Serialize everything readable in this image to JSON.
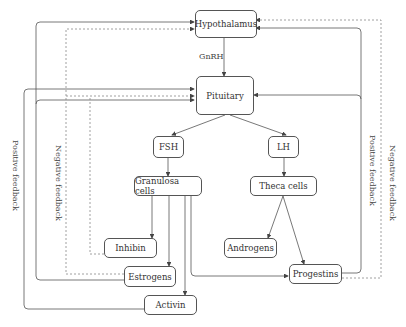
{
  "nodes": {
    "hypothalamus": "Hypothalamus",
    "pituitary": "Pituitary",
    "fsh": "FSH",
    "lh": "LH",
    "granulosa": "Granulosa cells",
    "theca": "Theca cells",
    "inhibin": "Inhibin",
    "estrogens": "Estrogens",
    "activin": "Activin",
    "androgens": "Androgens",
    "progestins": "Progestins"
  },
  "labels": {
    "gnrh": "GnRH",
    "positive_left": "Positive feedback",
    "negative_left": "Negative feedback",
    "positive_right": "Positive feedback",
    "negative_right": "Negative feedback"
  },
  "colors": {
    "line": "#555555",
    "dashed": "#888888"
  }
}
